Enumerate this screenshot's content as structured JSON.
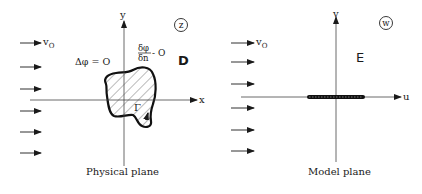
{
  "physical_plane": {
    "caption": "Physical plane",
    "axis_x_label": "x",
    "axis_y_label": "y",
    "plane_variable": "z",
    "flow_label": "v",
    "flow_label_sub": "O",
    "laplace_eq": "Δφ = O",
    "bc_numerator": "δφ",
    "bc_denominator": "δn",
    "bc_rhs": "- O",
    "domain_label": "D",
    "boundary_label": "Γ"
  },
  "model_plane": {
    "caption": "Model plane",
    "axis_u_label": "u",
    "axis_v_label": "v",
    "plane_variable": "w",
    "flow_label": "v",
    "flow_label_sub": "O",
    "domain_label": "E"
  },
  "colors": {
    "ink": "#1a1a1a",
    "axis": "#444444",
    "background": "#ffffff"
  }
}
